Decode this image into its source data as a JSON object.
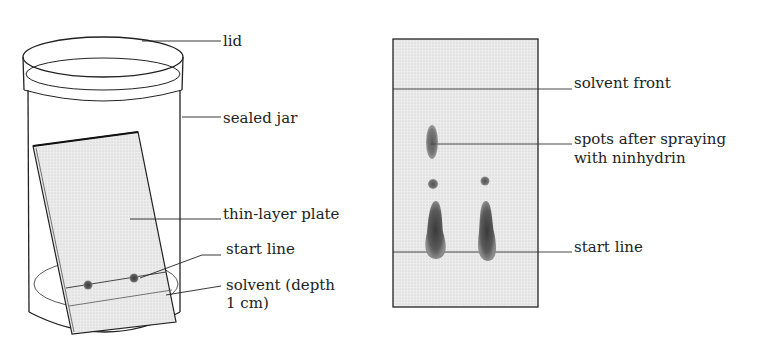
{
  "left_figure": {
    "title": "chromatography jar setup",
    "labels": {
      "lid": "lid",
      "sealed_jar": "sealed jar",
      "thin_layer_plate": "thin-layer plate",
      "start_line": "start line",
      "solvent_line1": "solvent (depth",
      "solvent_line2": "1 cm)"
    }
  },
  "right_figure": {
    "title": "developed chromatogram",
    "labels": {
      "solvent_front": "solvent front",
      "spots_line1": "spots after spraying",
      "spots_line2": "with ninhydrin",
      "start_line": "start line"
    }
  },
  "colors": {
    "ink": "#222222",
    "plate_fill": "#e6e6e6",
    "spot": "#555555"
  }
}
